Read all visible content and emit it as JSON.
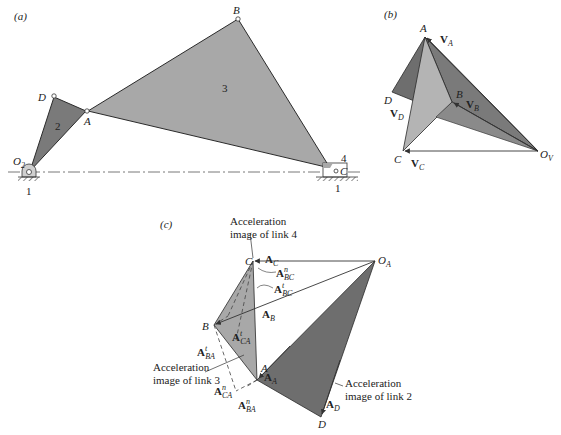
{
  "panels": {
    "a": {
      "label": "(a)",
      "points": {
        "O2": "O",
        "O2_sub": "2",
        "D": "D",
        "A": "A",
        "B": "B",
        "C": "C"
      },
      "links": {
        "link1_left": "1",
        "link1_right": "1",
        "link2": "2",
        "link3": "3",
        "link4": "4"
      }
    },
    "b": {
      "label": "(b)",
      "points": {
        "A": "A",
        "B": "B",
        "C": "C",
        "D": "D",
        "Ov": "O",
        "Ov_sub": "V"
      },
      "vectors": {
        "VA": {
          "main": "V",
          "sub": "A"
        },
        "VB": {
          "main": "V",
          "sub": "B"
        },
        "VC": {
          "main": "V",
          "sub": "C"
        },
        "VD": {
          "main": "V",
          "sub": "D"
        }
      }
    },
    "c": {
      "label": "(c)",
      "points": {
        "A": "A",
        "B": "B",
        "C": "C",
        "D": "D",
        "OA": "O",
        "OA_sub": "A"
      },
      "vectors": {
        "AC": {
          "main": "A",
          "sub": "C"
        },
        "AB": {
          "main": "A",
          "sub": "B"
        },
        "AA": {
          "main": "A",
          "sub": "A"
        },
        "AD": {
          "main": "A",
          "sub": "D"
        },
        "AnBC": {
          "main": "A",
          "sup": "n",
          "sub": "BC"
        },
        "AtBC": {
          "main": "A",
          "sup": "t",
          "sub": "BC"
        },
        "AtCA": {
          "main": "A",
          "sup": "t",
          "sub": "CA"
        },
        "AtBA": {
          "main": "A",
          "sup": "t",
          "sub": "BA"
        },
        "AnCA": {
          "main": "A",
          "sup": "n",
          "sub": "CA"
        },
        "AnBA": {
          "main": "A",
          "sup": "n",
          "sub": "BA"
        }
      },
      "captions": {
        "link4_line1": "Acceleration",
        "link4_line2": "image of link 4",
        "link3_line1": "Acceleration",
        "link3_line2": "image of link 3",
        "link2_line1": "Acceleration",
        "link2_line2": "image of link 2"
      }
    }
  },
  "colors": {
    "link2_fill": "#7a7a7a",
    "link3_fill": "#a8a8a8",
    "light_fill": "#b4b4b4",
    "dark_fill": "#6e6e6e",
    "stroke": "#2a2a2a"
  }
}
